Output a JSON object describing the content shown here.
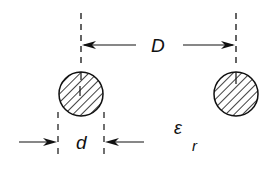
{
  "diagram": {
    "labels": {
      "spacing": "D",
      "diameter": "d",
      "permittivity_symbol": "ε",
      "permittivity_subscript": "r"
    },
    "conductors": [
      {
        "name": "left-conductor",
        "cx": 81,
        "cy": 94,
        "r": 22
      },
      {
        "name": "right-conductor",
        "cx": 236,
        "cy": 94,
        "r": 22
      }
    ],
    "colors": {
      "stroke": "#111111",
      "background": "#ffffff"
    }
  }
}
